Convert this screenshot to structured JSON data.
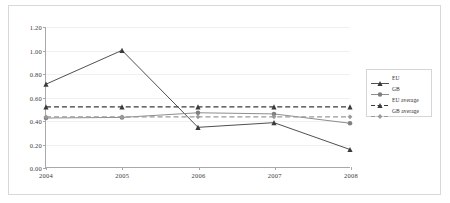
{
  "chart_data": {
    "type": "line",
    "title": "",
    "subtitle": "",
    "xlabel": "",
    "ylabel": "",
    "categories": [
      "2004",
      "2005",
      "2006",
      "2007",
      "2008"
    ],
    "x": [
      2004,
      2005,
      2006,
      2007,
      2008
    ],
    "ylim": [
      0.0,
      1.2
    ],
    "ytick_labels": [
      "0.00",
      "0.20",
      "0.40",
      "0.60",
      "0.80",
      "1.00",
      "1.20"
    ],
    "ytick_values": [
      0.0,
      0.2,
      0.4,
      0.6,
      0.8,
      1.0,
      1.2
    ],
    "grid": true,
    "legend_position": "right",
    "series": [
      {
        "name": "EU",
        "values": [
          0.71,
          1.0,
          0.34,
          0.38,
          0.15
        ],
        "style": "solid",
        "marker": "triangle",
        "color": "#3a3a3a"
      },
      {
        "name": "GB",
        "values": [
          0.42,
          0.425,
          0.465,
          0.455,
          0.375
        ],
        "style": "solid",
        "marker": "circle",
        "color": "#808080"
      },
      {
        "name": "EU average",
        "values": [
          0.515,
          0.515,
          0.515,
          0.515,
          0.515
        ],
        "style": "dashed",
        "marker": "triangle",
        "color": "#3a3a3a"
      },
      {
        "name": "GB average",
        "values": [
          0.43,
          0.43,
          0.43,
          0.43,
          0.43
        ],
        "style": "dashed",
        "marker": "diamond",
        "color": "#9a9a9a"
      }
    ]
  },
  "legend": {
    "items": [
      {
        "label": "EU"
      },
      {
        "label": "GB"
      },
      {
        "label": "EU average"
      },
      {
        "label": "GB average"
      }
    ]
  },
  "colors": {
    "eu": "#3a3a3a",
    "gb": "#808080",
    "eu_average": "#3a3a3a",
    "gb_average": "#9a9a9a",
    "axis": "#a9a9a9",
    "grid": "#f0f0f0",
    "frame": "#d8d8d8",
    "background": "#ffffff"
  }
}
